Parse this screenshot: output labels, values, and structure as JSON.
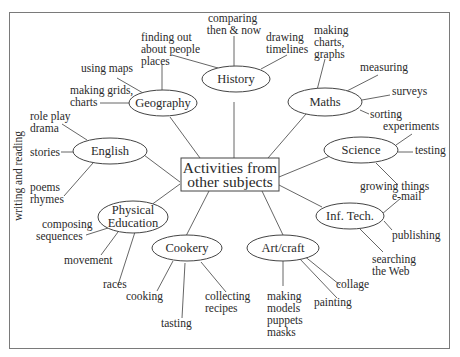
{
  "center": {
    "line1": "Activities from",
    "line2": "other subjects"
  },
  "side_label": "writing and reading",
  "nodes": {
    "history": {
      "label": "History",
      "leaves": [
        {
          "lines": [
            "comparing",
            "then & now"
          ]
        },
        {
          "lines": [
            "finding out",
            "about people",
            "places"
          ]
        },
        {
          "lines": [
            "drawing",
            "timelines"
          ]
        }
      ]
    },
    "geography": {
      "label": "Geography",
      "leaves": [
        {
          "lines": [
            "using maps"
          ]
        },
        {
          "lines": [
            "making grids,",
            "charts"
          ]
        }
      ]
    },
    "maths": {
      "label": "Maths",
      "leaves": [
        {
          "lines": [
            "making",
            "charts,",
            "graphs"
          ]
        },
        {
          "lines": [
            "measuring"
          ]
        },
        {
          "lines": [
            "surveys"
          ]
        },
        {
          "lines": [
            "sorting"
          ]
        }
      ]
    },
    "english": {
      "label": "English",
      "leaves": [
        {
          "lines": [
            "role play",
            "drama"
          ]
        },
        {
          "lines": [
            "stories"
          ]
        },
        {
          "lines": [
            "poems",
            "rhymes"
          ]
        }
      ]
    },
    "science": {
      "label": "Science",
      "leaves": [
        {
          "lines": [
            "experiments"
          ]
        },
        {
          "lines": [
            "testing"
          ]
        },
        {
          "lines": [
            "growing things"
          ]
        }
      ]
    },
    "pe": {
      "label_line1": "Physical",
      "label_line2": "Education",
      "leaves": [
        {
          "lines": [
            "composing",
            "sequences"
          ]
        },
        {
          "lines": [
            "movement"
          ]
        },
        {
          "lines": [
            "races"
          ]
        }
      ]
    },
    "it": {
      "label": "Inf. Tech.",
      "leaves": [
        {
          "lines": [
            "e-mail"
          ]
        },
        {
          "lines": [
            "publishing"
          ]
        },
        {
          "lines": [
            "searching",
            "the Web"
          ]
        }
      ]
    },
    "cookery": {
      "label": "Cookery",
      "leaves": [
        {
          "lines": [
            "cooking"
          ]
        },
        {
          "lines": [
            "tasting"
          ]
        },
        {
          "lines": [
            "collecting",
            "recipes"
          ]
        }
      ]
    },
    "art": {
      "label": "Art/craft",
      "leaves": [
        {
          "lines": [
            "making",
            "models",
            "puppets",
            "masks"
          ]
        },
        {
          "lines": [
            "painting"
          ]
        },
        {
          "lines": [
            "collage"
          ]
        }
      ]
    }
  }
}
